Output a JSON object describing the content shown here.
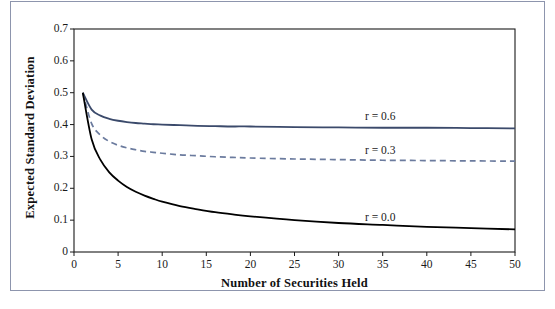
{
  "chart_data": {
    "type": "line",
    "title": "",
    "xlabel": "Number of Securities Held",
    "ylabel": "Expected Standard Deviation",
    "xlim": [
      0,
      50
    ],
    "ylim": [
      0,
      0.7
    ],
    "grid": false,
    "legend_position": "inline-right",
    "xticks": [
      "0",
      "5",
      "10",
      "15",
      "20",
      "25",
      "30",
      "35",
      "40",
      "45",
      "50"
    ],
    "xtick_values": [
      0,
      5,
      10,
      15,
      20,
      25,
      30,
      35,
      40,
      45,
      50
    ],
    "yticks": [
      "0",
      "0.1",
      "0.2",
      "0.3",
      "0.4",
      "0.5",
      "0.6",
      "0.7"
    ],
    "ytick_values": [
      0,
      0.1,
      0.2,
      0.3,
      0.4,
      0.5,
      0.6,
      0.7
    ],
    "series": [
      {
        "name": "r = 0.6",
        "label": "r = 0.6",
        "color": "#3b4a6b",
        "style": "solid",
        "x": [
          1,
          2,
          3,
          4,
          5,
          6,
          7,
          8,
          9,
          10,
          12,
          14,
          16,
          18,
          20,
          25,
          30,
          35,
          40,
          45,
          50
        ],
        "values": [
          0.5,
          0.447,
          0.428,
          0.418,
          0.412,
          0.408,
          0.405,
          0.403,
          0.401,
          0.4,
          0.398,
          0.396,
          0.395,
          0.394,
          0.394,
          0.392,
          0.391,
          0.39,
          0.39,
          0.389,
          0.388
        ]
      },
      {
        "name": "r = 0.3",
        "label": "r = 0.3",
        "color": "#6b7b9e",
        "style": "dashed",
        "x": [
          1,
          2,
          3,
          4,
          5,
          6,
          7,
          8,
          9,
          10,
          12,
          14,
          16,
          18,
          20,
          25,
          30,
          35,
          40,
          45,
          50
        ],
        "values": [
          0.5,
          0.403,
          0.367,
          0.347,
          0.335,
          0.327,
          0.321,
          0.316,
          0.313,
          0.31,
          0.305,
          0.302,
          0.299,
          0.297,
          0.295,
          0.292,
          0.29,
          0.288,
          0.287,
          0.286,
          0.285
        ]
      },
      {
        "name": "r = 0.0",
        "label": "r = 0.0",
        "color": "#000000",
        "style": "solid",
        "x": [
          1,
          2,
          3,
          4,
          5,
          6,
          7,
          8,
          9,
          10,
          12,
          14,
          16,
          18,
          20,
          25,
          30,
          35,
          40,
          45,
          50
        ],
        "values": [
          0.5,
          0.354,
          0.289,
          0.25,
          0.224,
          0.204,
          0.189,
          0.177,
          0.167,
          0.158,
          0.144,
          0.134,
          0.125,
          0.118,
          0.112,
          0.1,
          0.091,
          0.085,
          0.079,
          0.075,
          0.071
        ]
      }
    ],
    "annotations": [
      {
        "text": "r = 0.6",
        "x": 33,
        "y": 0.425
      },
      {
        "text": "r = 0.3",
        "x": 33,
        "y": 0.318
      },
      {
        "text": "r = 0.0",
        "x": 33,
        "y": 0.108
      }
    ]
  },
  "frame": {
    "border_color": "#8d95ad",
    "axis_color": "#1a1a1a"
  }
}
